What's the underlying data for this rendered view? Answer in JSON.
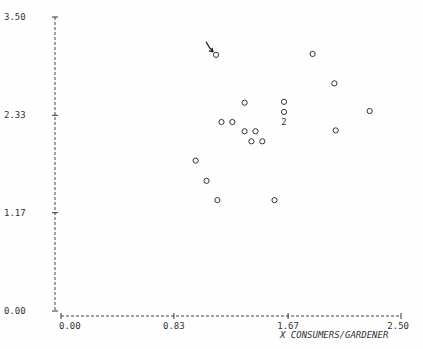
{
  "chart_data": {
    "type": "scatter",
    "title": "",
    "xlabel": "X   CONSUMERS/GARDENER",
    "ylabel": "",
    "xlim": [
      0.0,
      2.5
    ],
    "ylim": [
      0.0,
      3.5
    ],
    "x_ticks": [
      "0.00",
      "0.83",
      "1.67",
      "2.50"
    ],
    "y_ticks": [
      "0.00",
      "1.17",
      "2.33",
      "3.50"
    ],
    "grid": false,
    "points": [
      {
        "x": 1.14,
        "y": 3.05,
        "highlighted": true
      },
      {
        "x": 1.85,
        "y": 3.06
      },
      {
        "x": 2.01,
        "y": 2.71
      },
      {
        "x": 1.35,
        "y": 2.48
      },
      {
        "x": 1.64,
        "y": 2.49
      },
      {
        "x": 1.64,
        "y": 2.37
      },
      {
        "x": 2.27,
        "y": 2.38
      },
      {
        "x": 1.64,
        "y": 2.25,
        "count": 2
      },
      {
        "x": 1.18,
        "y": 2.25
      },
      {
        "x": 1.26,
        "y": 2.25
      },
      {
        "x": 1.35,
        "y": 2.14
      },
      {
        "x": 1.43,
        "y": 2.14
      },
      {
        "x": 2.02,
        "y": 2.15
      },
      {
        "x": 1.4,
        "y": 2.02
      },
      {
        "x": 1.48,
        "y": 2.02
      },
      {
        "x": 0.99,
        "y": 1.79
      },
      {
        "x": 1.07,
        "y": 1.55
      },
      {
        "x": 1.15,
        "y": 1.32
      },
      {
        "x": 1.57,
        "y": 1.32
      }
    ],
    "annotations": [
      {
        "type": "arrow",
        "target_point_index": 0
      }
    ]
  }
}
